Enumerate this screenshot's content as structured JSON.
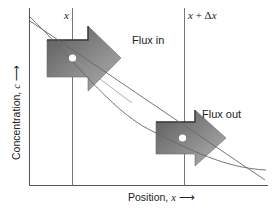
{
  "figure": {
    "type": "diffusion-flux-diagram",
    "axes": {
      "xlabel": "Position, x",
      "xlabel_arrow": "→",
      "ylabel": "Concentration, c",
      "ylabel_arrow": "→"
    },
    "markers": [
      {
        "label": "x",
        "position_px": 72
      },
      {
        "label": "x + Δx",
        "position_px": 184
      }
    ],
    "arrows": [
      {
        "label": "Flux in",
        "at": "x",
        "color": "#7a7a7a"
      },
      {
        "label": "Flux out",
        "at": "x + Δx",
        "color": "#7a7a7a"
      }
    ],
    "curves": [
      {
        "name": "concentration-profile",
        "shape": "decreasing, concave-up"
      },
      {
        "name": "tangent-line",
        "shape": "straight, decreasing"
      }
    ]
  },
  "labels": {
    "flux_in": "Flux in",
    "flux_out": "Flux out",
    "x": "x",
    "x_plus_dx_var": "x",
    "x_plus_dx_op": " + Δ",
    "x_plus_dx_var2": "x",
    "xlabel_text": "Position, ",
    "xlabel_var": "x",
    "xlabel_arrow": " ⟶",
    "ylabel_text": "Concentration, ",
    "ylabel_var": "c",
    "ylabel_arrow": " ⟶"
  },
  "colors": {
    "axis": "#555555",
    "arrow_dark": "#5e5e5e",
    "arrow_light": "#a8a8a8",
    "curve": "#666666"
  }
}
